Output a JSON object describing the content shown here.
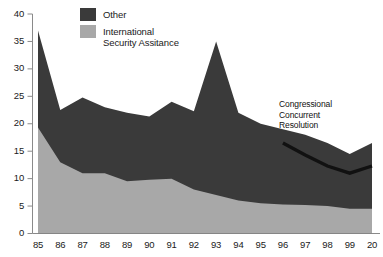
{
  "legend": {
    "position": "top-center",
    "items": [
      {
        "label": "Other",
        "color": "#3a3a3a",
        "key": "other"
      },
      {
        "label": "International\nSecurity Assitance",
        "color": "#a8a8a8",
        "key": "isa"
      }
    ]
  },
  "annotation": {
    "text": "Congressional\nConcurrent\nResolution",
    "color": "#111111"
  },
  "colors": {
    "other_fill": "#3a3a3a",
    "isa_fill": "#a8a8a8",
    "axis": "#888888",
    "text": "#1a1a1a",
    "resolution_line": "#111111",
    "background": "#ffffff"
  },
  "axes": {
    "y_ticks": [
      "0",
      "5",
      "10",
      "15",
      "20",
      "25",
      "30",
      "35",
      "40"
    ],
    "x_ticks": [
      "85",
      "86",
      "87",
      "88",
      "89",
      "90",
      "91",
      "92",
      "93",
      "94",
      "95",
      "96",
      "97",
      "98",
      "99",
      "20"
    ]
  },
  "chart_data": {
    "type": "area",
    "title": "",
    "subtitle": "",
    "xlabel": "",
    "ylabel": "",
    "xlim": [
      0,
      15
    ],
    "ylim": [
      0,
      40
    ],
    "grid": false,
    "stacked": true,
    "legend_position": "top-center",
    "categories": [
      "85",
      "86",
      "87",
      "88",
      "89",
      "90",
      "91",
      "92",
      "93",
      "94",
      "95",
      "96",
      "97",
      "98",
      "99",
      "20"
    ],
    "series": [
      {
        "name": "International Security Assitance",
        "color": "#a8a8a8",
        "values": [
          19.3,
          13.0,
          11.0,
          11.0,
          9.5,
          9.8,
          10.0,
          8.0,
          7.0,
          6.0,
          5.5,
          5.3,
          5.2,
          5.0,
          4.5,
          4.5
        ]
      },
      {
        "name": "Other",
        "color": "#3a3a3a",
        "values": [
          17.7,
          9.5,
          13.8,
          12.0,
          12.5,
          11.5,
          14.0,
          14.3,
          28.0,
          16.0,
          14.5,
          13.7,
          12.8,
          11.5,
          10.0,
          12.0
        ]
      }
    ],
    "totals": [
      37.0,
      22.5,
      24.8,
      23.0,
      22.0,
      21.3,
      24.0,
      22.3,
      35.0,
      22.0,
      20.0,
      19.0,
      18.0,
      16.5,
      14.5,
      16.5
    ],
    "overlay_lines": [
      {
        "name": "Congressional Concurrent Resolution",
        "color": "#111111",
        "x_categories": [
          "96",
          "97",
          "98",
          "99",
          "20"
        ],
        "values": [
          16.5,
          14.3,
          12.3,
          11.0,
          12.3
        ]
      }
    ]
  }
}
